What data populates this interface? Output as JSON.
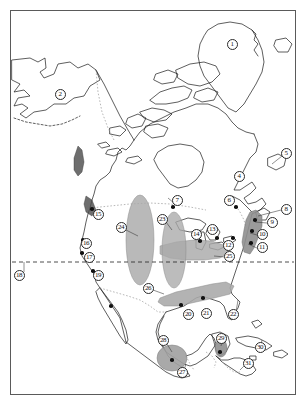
{
  "figure": {
    "type": "distribution-map",
    "title": "",
    "region": "North America and Central America",
    "frame": {
      "x": 10,
      "y": 10,
      "width": 286,
      "height": 385,
      "border_color": "#5a5a5a"
    },
    "background_color": "#ffffff",
    "coastline_color": "#1a1a1a",
    "border_dotted_color": "#9a9a9a"
  },
  "legend_lines": {
    "latitude_dashed_line": {
      "style": "dashed",
      "color": "#222222",
      "y": 262,
      "x_start": 12,
      "x_end": 294,
      "label_ref": "18"
    }
  },
  "shaded_ranges": [
    {
      "id": "range-24",
      "label": "24",
      "shape": "vertical-ellipse",
      "fill": "#a9a9a9",
      "opacity": 0.8,
      "cx": 140,
      "cy": 240,
      "rx": 14,
      "ry": 45
    },
    {
      "id": "range-23",
      "label": "23",
      "shape": "vertical-ellipse",
      "fill": "#a9a9a9",
      "opacity": 0.8,
      "cx": 174,
      "cy": 250,
      "rx": 12,
      "ry": 38
    },
    {
      "id": "range-25",
      "label": "25",
      "shape": "horizontal-lobe",
      "fill": "#a9a9a9",
      "opacity": 0.8
    },
    {
      "id": "range-26",
      "label": "26",
      "shape": "diagonal-band",
      "fill": "#a9a9a9",
      "opacity": 0.85
    },
    {
      "id": "range-appalachian",
      "label": "8",
      "shape": "narrow-strip",
      "fill": "#8f8f8f",
      "opacity": 0.9
    },
    {
      "id": "range-28",
      "label": "28",
      "shape": "ellipse",
      "fill": "#a0a0a0",
      "opacity": 0.9,
      "cx": 172,
      "cy": 358,
      "rx": 15,
      "ry": 13
    },
    {
      "id": "range-29",
      "label": "29",
      "shape": "small-blob",
      "fill": "#8f8f8f",
      "opacity": 0.9,
      "cx": 221,
      "cy": 348,
      "rx": 6,
      "ry": 9
    },
    {
      "id": "range-coast-north",
      "shape": "dark-strip",
      "fill": "#4a4a4a",
      "opacity": 0.85
    },
    {
      "id": "range-coast-south",
      "shape": "dark-strip",
      "fill": "#4a4a4a",
      "opacity": 0.85
    }
  ],
  "markers": [
    {
      "id": 1,
      "label": "1",
      "x": 232,
      "y": 44,
      "place": "Greenland"
    },
    {
      "id": 2,
      "label": "2",
      "x": 60,
      "y": 94,
      "place": "Alaska"
    },
    {
      "id": 4,
      "label": "4",
      "x": 239,
      "y": 176,
      "place": "eastern Canada"
    },
    {
      "id": 5,
      "label": "5",
      "x": 286,
      "y": 153,
      "place": "Newfoundland"
    },
    {
      "id": 6,
      "label": "6",
      "x": 229,
      "y": 200,
      "place": "Quebec"
    },
    {
      "id": 7,
      "label": "7",
      "x": 177,
      "y": 200,
      "place": "Manitoba"
    },
    {
      "id": 8,
      "label": "8",
      "x": 286,
      "y": 209,
      "place": "Northern Appalachians"
    },
    {
      "id": 9,
      "label": "9",
      "x": 272,
      "y": 222,
      "place": "New England"
    },
    {
      "id": 10,
      "label": "10",
      "x": 262,
      "y": 234,
      "place": "Mid-Atlantic"
    },
    {
      "id": 11,
      "label": "11",
      "x": 262,
      "y": 247,
      "place": "Southern Appalachians"
    },
    {
      "id": 12,
      "label": "12",
      "x": 228,
      "y": 245,
      "place": "Ohio Valley"
    },
    {
      "id": 13,
      "label": "13",
      "x": 212,
      "y": 229,
      "place": "Great Lakes east"
    },
    {
      "id": 14,
      "label": "14",
      "x": 196,
      "y": 234,
      "place": "Great Lakes west"
    },
    {
      "id": 15,
      "label": "15",
      "x": 98,
      "y": 214,
      "place": "Pacific Northwest"
    },
    {
      "id": 16,
      "label": "16",
      "x": 86,
      "y": 243,
      "place": "Northern California"
    },
    {
      "id": 17,
      "label": "17",
      "x": 89,
      "y": 257,
      "place": "Central California"
    },
    {
      "id": 18,
      "label": "18",
      "x": 19,
      "y": 275,
      "place": "latitude reference"
    },
    {
      "id": 19,
      "label": "19",
      "x": 98,
      "y": 275,
      "place": "Southern California"
    },
    {
      "id": 20,
      "label": "20",
      "x": 188,
      "y": 314,
      "place": "Texas"
    },
    {
      "id": 21,
      "label": "21",
      "x": 206,
      "y": 313,
      "place": "Gulf Coast"
    },
    {
      "id": 22,
      "label": "22",
      "x": 233,
      "y": 314,
      "place": "Florida"
    },
    {
      "id": 23,
      "label": "23",
      "x": 162,
      "y": 219,
      "place": "Northern Plains"
    },
    {
      "id": 24,
      "label": "24",
      "x": 121,
      "y": 227,
      "place": "Rocky Mountains"
    },
    {
      "id": 25,
      "label": "25",
      "x": 229,
      "y": 256,
      "place": "Midwest"
    },
    {
      "id": 26,
      "label": "26",
      "x": 148,
      "y": 288,
      "place": "Southern Plains"
    },
    {
      "id": 27,
      "label": "27",
      "x": 182,
      "y": 372,
      "place": "Southern Mexico"
    },
    {
      "id": 28,
      "label": "28",
      "x": 163,
      "y": 340,
      "place": "Central Mexico"
    },
    {
      "id": 29,
      "label": "29",
      "x": 221,
      "y": 338,
      "place": "Yucatan"
    },
    {
      "id": 30,
      "label": "30",
      "x": 260,
      "y": 347,
      "place": "Caribbean"
    },
    {
      "id": 31,
      "label": "31",
      "x": 248,
      "y": 363,
      "place": "Central America"
    }
  ],
  "sample_dots": [
    {
      "x": 173,
      "y": 207
    },
    {
      "x": 236,
      "y": 207
    },
    {
      "x": 200,
      "y": 241
    },
    {
      "x": 217,
      "y": 238
    },
    {
      "x": 233,
      "y": 238
    },
    {
      "x": 255,
      "y": 220
    },
    {
      "x": 252,
      "y": 231
    },
    {
      "x": 251,
      "y": 243
    },
    {
      "x": 83,
      "y": 240
    },
    {
      "x": 82,
      "y": 253
    },
    {
      "x": 93,
      "y": 271
    },
    {
      "x": 92,
      "y": 209
    },
    {
      "x": 181,
      "y": 305
    },
    {
      "x": 203,
      "y": 298
    },
    {
      "x": 172,
      "y": 360
    },
    {
      "x": 220,
      "y": 352
    },
    {
      "x": 111,
      "y": 306
    }
  ]
}
